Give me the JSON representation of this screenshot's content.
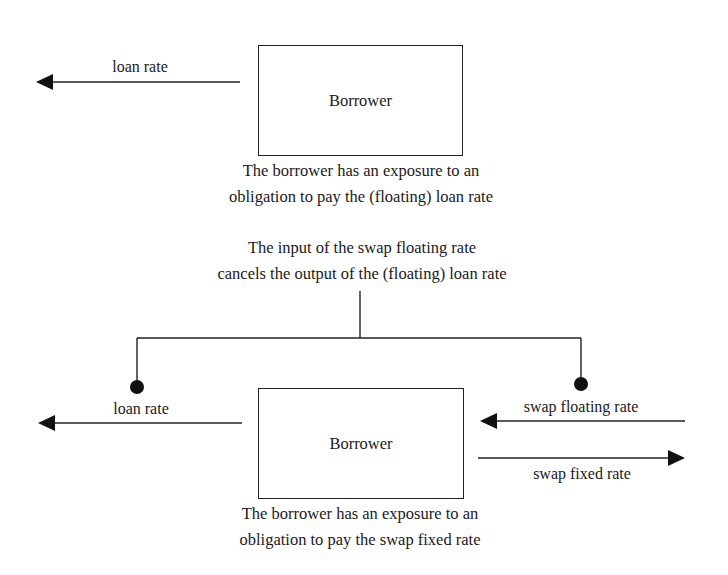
{
  "top_panel": {
    "box_label": "Borrower",
    "arrow_label": "loan rate",
    "caption": [
      "The borrower has an exposure to an",
      "obligation to pay the (floating) loan rate"
    ]
  },
  "middle_note": {
    "lines": [
      "The input of the swap floating rate",
      "cancels the output of the (floating) loan rate"
    ]
  },
  "bottom_panel": {
    "box_label": "Borrower",
    "left_arrow_label": "loan rate",
    "swap_floating_label": "swap floating rate",
    "swap_fixed_label": "swap fixed rate",
    "caption": [
      "The borrower has an exposure to an",
      "obligation to pay the swap fixed rate"
    ]
  },
  "colors": {
    "stroke": "#222222",
    "text": "#1a1a1a",
    "background": "#ffffff"
  }
}
